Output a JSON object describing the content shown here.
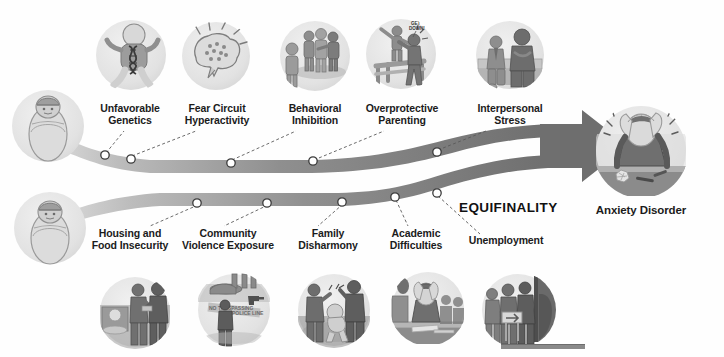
{
  "diagram": {
    "center_label": "EQUIFINALITY",
    "outcome": {
      "label": "Anxiety Disorder",
      "icon_name": "distressed-person-head-in-hands-icon"
    },
    "origins": [
      {
        "id": "origin-top",
        "icon_name": "swaddled-infant-icon",
        "label": ""
      },
      {
        "id": "origin-bottom",
        "icon_name": "swaddled-infant-icon",
        "label": ""
      }
    ],
    "pathways": [
      {
        "id": "pathway-biological",
        "position": "top",
        "factors": [
          {
            "label": "Unfavorable\nGenetics",
            "icon_name": "infant-dna-genetics-icon"
          },
          {
            "label": "Fear Circuit\nHyperactivity",
            "icon_name": "brain-fear-circuit-icon"
          },
          {
            "label": "Behavioral\nInhibition",
            "icon_name": "shy-child-peer-group-icon"
          },
          {
            "label": "Overprotective\nParenting",
            "icon_name": "overprotective-parent-icon",
            "speech": "GET\nDOWN!"
          },
          {
            "label": "Interpersonal\nStress",
            "icon_name": "interpersonal-stress-bench-icon"
          }
        ]
      },
      {
        "id": "pathway-environmental",
        "position": "bottom",
        "factors": [
          {
            "label": "Housing and\nFood Insecurity",
            "icon_name": "food-bank-line-icon"
          },
          {
            "label": "Community\nViolence Exposure",
            "icon_name": "community-violence-icon"
          },
          {
            "label": "Family\nDisharmony",
            "icon_name": "family-conflict-icon"
          },
          {
            "label": "Academic\nDifficulties",
            "icon_name": "student-stress-desk-icon"
          },
          {
            "label": "Unemployment",
            "icon_name": "unemployment-line-icon"
          }
        ]
      }
    ],
    "colors": {
      "band": "#7b7b7b",
      "band_light": "#c9c9c9",
      "icon_bg": "#e8e8e8",
      "text": "#1b1b1b",
      "dot_fill": "#ffffff",
      "dot_stroke": "#333333",
      "footer_bar": "#8a8a8a"
    }
  }
}
